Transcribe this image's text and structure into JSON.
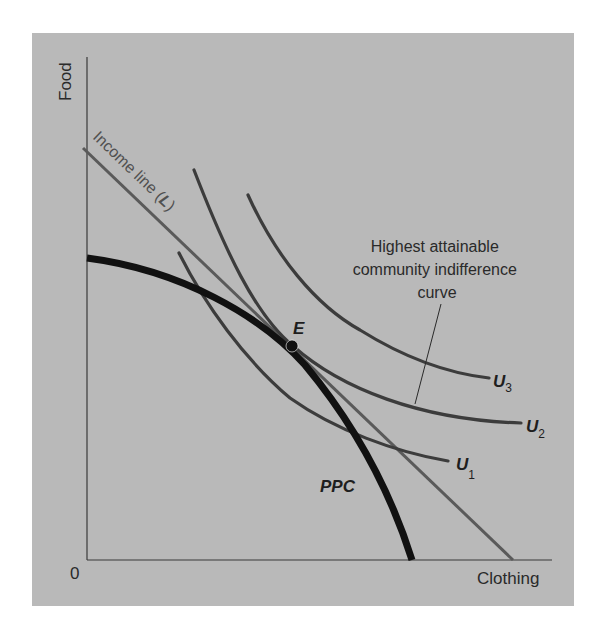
{
  "figure": {
    "background_color": "#ffffff",
    "panel_color": "#b9b9b9",
    "axes": {
      "y_label": "Food",
      "x_label": "Clothing",
      "origin_label": "0"
    },
    "curves": {
      "ppc": {
        "label": "PPC",
        "color": "#111111"
      },
      "income_line": {
        "label_prefix": "Income line (",
        "label_var": "L",
        "label_suffix": ")",
        "color": "#5a5a5a"
      },
      "u1": {
        "label": "U",
        "subscript": "1",
        "color": "#3c3c3c"
      },
      "u2": {
        "label": "U",
        "subscript": "2",
        "color": "#3c3c3c"
      },
      "u3": {
        "label": "U",
        "subscript": "3",
        "color": "#3c3c3c"
      }
    },
    "equilibrium_point": {
      "label": "E"
    },
    "annotation": {
      "lines": [
        "Highest attainable",
        "community indifference",
        "curve"
      ]
    }
  }
}
